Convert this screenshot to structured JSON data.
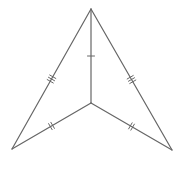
{
  "figure": {
    "type": "geometry-diagram",
    "stroke_color": "#666666",
    "background": "#ffffff",
    "points": {
      "apex": [
        91,
        9
      ],
      "center": [
        91,
        103
      ],
      "bottom_left": [
        12,
        149
      ],
      "bottom_right": [
        172,
        150
      ]
    },
    "segments": [
      {
        "name": "apex-bottom-left",
        "from": "apex",
        "to": "bottom_left",
        "ticks": 3
      },
      {
        "name": "apex-bottom-right",
        "from": "apex",
        "to": "bottom_right",
        "ticks": 3
      },
      {
        "name": "apex-center",
        "from": "apex",
        "to": "center",
        "ticks": 1
      },
      {
        "name": "center-bottom-left",
        "from": "center",
        "to": "bottom_left",
        "ticks": 2
      },
      {
        "name": "center-bottom-right",
        "from": "center",
        "to": "bottom_right",
        "ticks": 2
      }
    ]
  }
}
